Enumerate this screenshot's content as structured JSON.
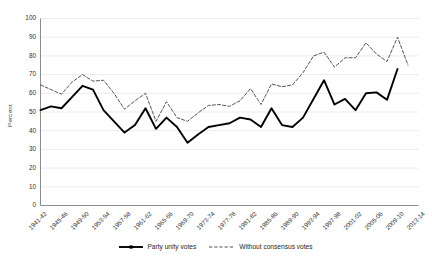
{
  "axes": {
    "ylabel": "Percent",
    "yticks": [
      "0",
      "10",
      "20",
      "30",
      "40",
      "50",
      "60",
      "70",
      "80",
      "90",
      "100"
    ],
    "xticks": [
      "1941-42",
      "1945-46",
      "1949-50",
      "1953-54",
      "1957-58",
      "1961-62",
      "1965-66",
      "1969-70",
      "1973-74",
      "1977-78",
      "1981-82",
      "1985-86",
      "1989-90",
      "1993-94",
      "1997-98",
      "2001-02",
      "2005-06",
      "2009-10",
      "2013-14"
    ]
  },
  "legend": {
    "items": [
      {
        "label": "Party unity votes",
        "style": "solid",
        "color": "#000000"
      },
      {
        "label": "Without consensus votes",
        "style": "dashed",
        "color": "#4d4d4d"
      }
    ]
  },
  "colors": {
    "series_solid": "#000000",
    "series_dashed": "#555555",
    "gridline": "#e6e6e6",
    "axis": "#8c8c8c",
    "text": "#231f20",
    "background": "#ffffff"
  },
  "chart_data": {
    "type": "line",
    "title": "",
    "xlabel": "",
    "ylabel": "Percent",
    "ylim": [
      0,
      100
    ],
    "ytick_step": 10,
    "grid": true,
    "legend_position": "bottom-center",
    "x": [
      "1941-42",
      "1943-44",
      "1945-46",
      "1947-48",
      "1949-50",
      "1951-52",
      "1953-54",
      "1955-56",
      "1957-58",
      "1959-60",
      "1961-62",
      "1963-64",
      "1965-66",
      "1967-68",
      "1969-70",
      "1971-72",
      "1973-74",
      "1975-76",
      "1977-78",
      "1979-80",
      "1981-82",
      "1983-84",
      "1985-86",
      "1987-88",
      "1989-90",
      "1991-92",
      "1993-94",
      "1995-96",
      "1997-98",
      "1999-2000",
      "2001-02",
      "2003-04",
      "2005-06",
      "2007-08",
      "2009-10",
      "2011-12",
      "2013-14"
    ],
    "xtick_labels_shown": [
      "1941-42",
      "1945-46",
      "1949-50",
      "1953-54",
      "1957-58",
      "1961-62",
      "1965-66",
      "1969-70",
      "1973-74",
      "1977-78",
      "1981-82",
      "1985-86",
      "1989-90",
      "1993-94",
      "1997-98",
      "2001-02",
      "2005-06",
      "2009-10",
      "2013-14"
    ],
    "series": [
      {
        "name": "Party unity votes",
        "style": "solid",
        "color": "#000000",
        "values": [
          51,
          53,
          52,
          58,
          64,
          62,
          51,
          45,
          39,
          43,
          52,
          41,
          47,
          42,
          33.5,
          38,
          42,
          43,
          44,
          47,
          46,
          42,
          52,
          43,
          42,
          47,
          57,
          67,
          54,
          57,
          51,
          60,
          60.5,
          56.5,
          73,
          null,
          null
        ]
      },
      {
        "name": "Without consensus votes",
        "style": "dashed",
        "color": "#555555",
        "values": [
          64.5,
          62,
          59.5,
          66,
          70,
          66.5,
          67,
          60,
          51.5,
          56,
          60,
          45,
          55.5,
          47,
          45,
          49.5,
          53.5,
          54,
          53,
          56,
          62.5,
          54,
          65,
          63.5,
          64.5,
          71,
          80,
          82,
          74,
          79,
          79,
          87,
          81,
          77,
          90,
          75,
          null
        ]
      }
    ]
  }
}
